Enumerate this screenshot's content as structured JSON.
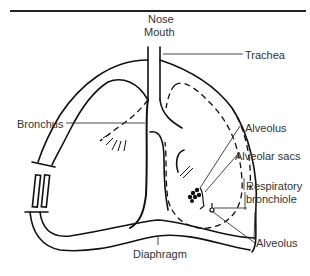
{
  "figure": {
    "top_rule": true,
    "labels": {
      "nose": "Nose",
      "mouth": "Mouth",
      "trachea": "Trachea",
      "bronchus": "Bronchus",
      "alveolus_top": "Alveolus",
      "alveolar_sacs": "Alveolar sacs",
      "respiratory": "Respiratory",
      "bronchiole": "bronchiole",
      "alveolus_bottom": "Alveolus",
      "diaphragm": "Diaphragm"
    }
  }
}
